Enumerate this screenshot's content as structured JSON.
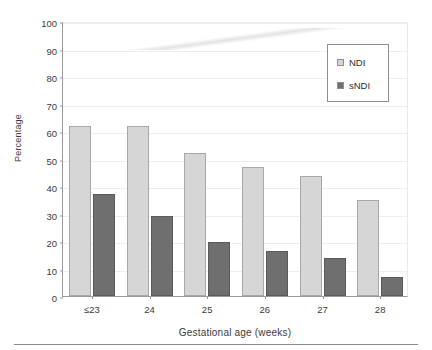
{
  "chart_data": {
    "type": "bar",
    "title": "",
    "xlabel": "Gestational age (weeks)",
    "ylabel": "Percentage",
    "categories": [
      "≤23",
      "24",
      "25",
      "26",
      "27",
      "28"
    ],
    "series": [
      {
        "name": "NDI",
        "color": "#d6d6d6",
        "values": [
          62,
          62,
          52,
          47,
          43.5,
          35
        ]
      },
      {
        "name": "sNDI",
        "color": "#6f6f6f",
        "values": [
          37,
          29,
          19.5,
          16.5,
          14,
          7
        ]
      }
    ],
    "ylim": [
      0,
      100
    ],
    "ytick_step": 10,
    "yticks": [
      "0",
      "10",
      "20",
      "30",
      "40",
      "50",
      "60",
      "70",
      "80",
      "90",
      "100"
    ],
    "grid": true,
    "legend_position": "top-right",
    "legend_entries": [
      "NDI",
      "sNDI"
    ]
  },
  "axes": {
    "y_title": "Percentage",
    "x_title": "Gestational age (weeks)"
  },
  "legend": {
    "items": [
      {
        "label": "NDI",
        "swatch": "light-gray-swatch-icon"
      },
      {
        "label": "sNDI",
        "swatch": "dark-gray-swatch-icon"
      }
    ]
  }
}
